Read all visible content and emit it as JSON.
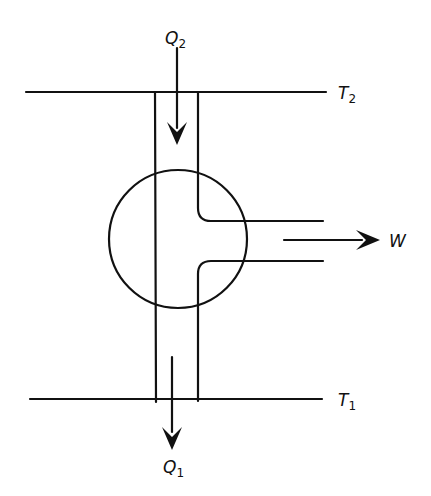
{
  "diagram": {
    "type": "heat-engine-schematic",
    "colors": {
      "stroke": "#111111",
      "background": "#ffffff"
    },
    "reservoirs": {
      "hot": {
        "symbol": "T",
        "subscript": "2"
      },
      "cold": {
        "symbol": "T",
        "subscript": "1"
      }
    },
    "heat_flows": {
      "in": {
        "symbol": "Q",
        "subscript": "2"
      },
      "out": {
        "symbol": "Q",
        "subscript": "1"
      }
    },
    "work_output": {
      "symbol": "W"
    }
  }
}
